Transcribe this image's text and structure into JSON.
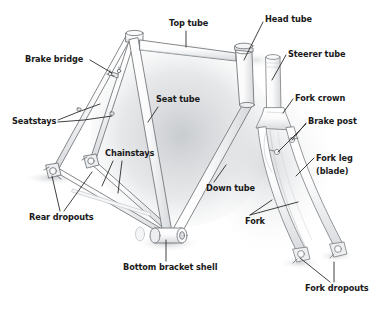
{
  "diagram": {
    "style": "pencil-sketch line drawing, grayscale",
    "background_color": "#ffffff",
    "label_color": "#1a1a1a",
    "leader_line_color": "#2b2b2b",
    "sketch_stroke_color": "#6e7276",
    "sketch_fill_color": "#f2f3f4",
    "shadow_color": "#b9bcc0",
    "width": 380,
    "height": 311
  },
  "labels": [
    {
      "id": "brake-bridge",
      "text": "Brake bridge",
      "x": 25,
      "y": 55,
      "align": "left"
    },
    {
      "id": "seatstays",
      "text": "Seatstays",
      "x": 12,
      "y": 117,
      "align": "left"
    },
    {
      "id": "top-tube",
      "text": "Top tube",
      "x": 169,
      "y": 19,
      "align": "left"
    },
    {
      "id": "head-tube",
      "text": "Head tube",
      "x": 265,
      "y": 15,
      "align": "left"
    },
    {
      "id": "steerer-tube",
      "text": "Steerer tube",
      "x": 288,
      "y": 50,
      "align": "left"
    },
    {
      "id": "fork-crown",
      "text": "Fork crown",
      "x": 295,
      "y": 94,
      "align": "left"
    },
    {
      "id": "brake-post",
      "text": "Brake post",
      "x": 308,
      "y": 117,
      "align": "left"
    },
    {
      "id": "fork-leg-blade",
      "text": "Fork leg\n(blade)",
      "x": 316,
      "y": 152,
      "align": "left"
    },
    {
      "id": "seat-tube",
      "text": "Seat tube",
      "x": 156,
      "y": 95,
      "align": "left"
    },
    {
      "id": "down-tube",
      "text": "Down tube",
      "x": 206,
      "y": 184,
      "align": "left"
    },
    {
      "id": "chainstays",
      "text": "Chainstays",
      "x": 105,
      "y": 149,
      "align": "left"
    },
    {
      "id": "rear-dropouts",
      "text": "Rear dropouts",
      "x": 29,
      "y": 213,
      "align": "left"
    },
    {
      "id": "bottom-bracket-shell",
      "text": "Bottom bracket shell",
      "x": 123,
      "y": 263,
      "align": "left"
    },
    {
      "id": "fork",
      "text": "Fork",
      "x": 245,
      "y": 217,
      "align": "left"
    },
    {
      "id": "fork-dropouts",
      "text": "Fork dropouts",
      "x": 305,
      "y": 284,
      "align": "left"
    }
  ],
  "leader_lines": [
    {
      "id": "brake-bridge-leader",
      "points": "90,60 112,73"
    },
    {
      "id": "seatstays-leader-a",
      "points": "58,120 78,112 100,104"
    },
    {
      "id": "seatstays-leader-b",
      "points": "58,122 84,120 112,116"
    },
    {
      "id": "top-tube-leader",
      "points": "186,31 186,47"
    },
    {
      "id": "head-tube-leader",
      "points": "263,22 244,60"
    },
    {
      "id": "steerer-tube-leader",
      "points": "286,55 272,80"
    },
    {
      "id": "fork-crown-leader",
      "points": "293,99 283,113"
    },
    {
      "id": "brake-post-leader-a",
      "points": "306,123 292,140"
    },
    {
      "id": "brake-post-leader-b",
      "points": "306,124 278,152"
    },
    {
      "id": "fork-leg-leader",
      "points": "314,158 296,176"
    },
    {
      "id": "seat-tube-leader",
      "points": "158,107 148,122"
    },
    {
      "id": "down-tube-leader",
      "points": "214,182 226,165"
    },
    {
      "id": "chainstays-leader-a",
      "points": "113,161 102,186"
    },
    {
      "id": "chainstays-leader-b",
      "points": "122,161 118,193"
    },
    {
      "id": "rear-dropouts-leader-a",
      "points": "60,211 52,176"
    },
    {
      "id": "rear-dropouts-leader-b",
      "points": "64,211 92,172"
    },
    {
      "id": "bottom-bracket-leader",
      "points": "166,261 166,240"
    },
    {
      "id": "fork-leader-a",
      "points": "250,215 272,200"
    },
    {
      "id": "fork-leader-b",
      "points": "250,215 298,202"
    },
    {
      "id": "fork-dropouts-leader-a",
      "points": "330,282 300,258"
    },
    {
      "id": "fork-dropouts-leader-b",
      "points": "334,282 334,262"
    }
  ]
}
